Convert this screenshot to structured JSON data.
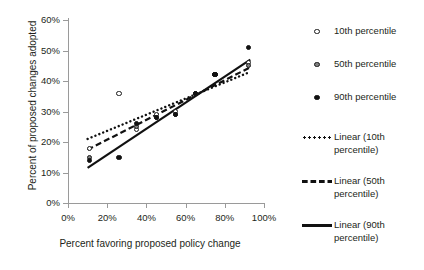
{
  "chart_data": {
    "type": "scatter",
    "title": "",
    "xlabel": "Percent favoring proposed policy change",
    "ylabel": "Percent  of proposed changes adopted",
    "xlim": [
      0,
      100
    ],
    "ylim": [
      0,
      60
    ],
    "grid": false,
    "legend_position": "right",
    "xticks": [
      "0%",
      "20%",
      "40%",
      "60%",
      "80%",
      "100%"
    ],
    "xtick_values": [
      0,
      20,
      40,
      60,
      80,
      100
    ],
    "yticks": [
      "0%",
      "10%",
      "20%",
      "30%",
      "40%",
      "50%",
      "60%"
    ],
    "ytick_values": [
      0,
      10,
      20,
      30,
      40,
      50,
      60
    ],
    "series": [
      {
        "name": "10th percentile",
        "marker": "open-circle",
        "color": "#ffffff",
        "edge_color": "#1a1a1a",
        "points": [
          {
            "x": 11,
            "y": 18
          },
          {
            "x": 26,
            "y": 36
          },
          {
            "x": 35,
            "y": 24
          },
          {
            "x": 45,
            "y": 29
          },
          {
            "x": 55,
            "y": 30
          },
          {
            "x": 65,
            "y": 36
          },
          {
            "x": 75,
            "y": 42
          },
          {
            "x": 92,
            "y": 46
          }
        ]
      },
      {
        "name": "50th percentile",
        "marker": "gray-circle",
        "color": "#808080",
        "edge_color": "#1a1a1a",
        "points": [
          {
            "x": 11,
            "y": 15
          },
          {
            "x": 35,
            "y": 25
          },
          {
            "x": 45,
            "y": 28
          },
          {
            "x": 55,
            "y": 29
          },
          {
            "x": 65,
            "y": 36
          },
          {
            "x": 75,
            "y": 42
          },
          {
            "x": 92,
            "y": 45
          }
        ]
      },
      {
        "name": "90th percentile",
        "marker": "filled-circle",
        "color": "#111111",
        "edge_color": "#111111",
        "points": [
          {
            "x": 11,
            "y": 14
          },
          {
            "x": 26,
            "y": 15
          },
          {
            "x": 35,
            "y": 26
          },
          {
            "x": 45,
            "y": 28
          },
          {
            "x": 55,
            "y": 29
          },
          {
            "x": 65,
            "y": 36
          },
          {
            "x": 75,
            "y": 42
          },
          {
            "x": 92,
            "y": 51
          }
        ]
      }
    ],
    "trendlines": [
      {
        "name": "Linear (10th percentile)",
        "style": "dotted",
        "color": "#111111",
        "x0": 10,
        "y0": 21.0,
        "x1": 93,
        "y1": 43.0
      },
      {
        "name": "Linear (50th percentile)",
        "style": "dashed",
        "color": "#111111",
        "x0": 10,
        "y0": 17.5,
        "x1": 93,
        "y1": 44.5
      },
      {
        "name": "Linear (90th percentile)",
        "style": "solid",
        "color": "#111111",
        "x0": 10,
        "y0": 11.5,
        "x1": 93,
        "y1": 47.0
      }
    ]
  },
  "legend": {
    "items": [
      {
        "key": "open-circle-marker",
        "label": "10th percentile"
      },
      {
        "key": "gray-circle-marker",
        "label": "50th percentile"
      },
      {
        "key": "filled-circle-marker",
        "label": "90th percentile"
      },
      {
        "key": "dotted-line",
        "label": "Linear (10th percentile)"
      },
      {
        "key": "dashed-line",
        "label": "Linear (50th percentile)"
      },
      {
        "key": "solid-line",
        "label": "Linear (90th percentile)"
      }
    ]
  }
}
